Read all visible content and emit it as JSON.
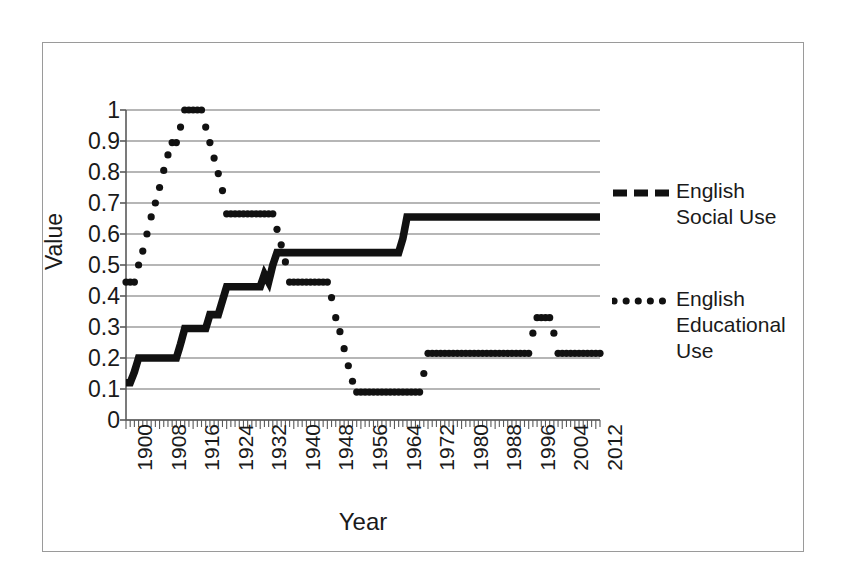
{
  "chart_data": {
    "type": "line",
    "title": "",
    "xlabel": "Year",
    "ylabel": "Value",
    "xlim": [
      1900,
      2013
    ],
    "ylim": [
      0,
      1
    ],
    "grid": true,
    "grid_axis": "y",
    "legend_position": "right",
    "y_ticks": [
      "0",
      "0.1",
      "0.2",
      "0.3",
      "0.4",
      "0.5",
      "0.6",
      "0.7",
      "0.8",
      "0.9",
      "1"
    ],
    "y_tick_values": [
      0,
      0.1,
      0.2,
      0.3,
      0.4,
      0.5,
      0.6,
      0.7,
      0.8,
      0.9,
      1
    ],
    "x_ticks": [
      "1900",
      "1908",
      "1916",
      "1924",
      "1932",
      "1940",
      "1948",
      "1956",
      "1964",
      "1972",
      "1980",
      "1988",
      "1996",
      "2004",
      "2012"
    ],
    "x_tick_values": [
      1900,
      1908,
      1916,
      1924,
      1932,
      1940,
      1948,
      1956,
      1964,
      1972,
      1980,
      1988,
      1996,
      2004,
      2012
    ],
    "x_minor_tick_step": 1,
    "series": [
      {
        "name": "English Social Use",
        "style": "dashed",
        "marker": "dash",
        "color": "#111111",
        "points": [
          [
            1900,
            0.12
          ],
          [
            1901,
            0.12
          ],
          [
            1902,
            0.155
          ],
          [
            1903,
            0.2
          ],
          [
            1904,
            0.2
          ],
          [
            1905,
            0.2
          ],
          [
            1906,
            0.2
          ],
          [
            1907,
            0.2
          ],
          [
            1908,
            0.2
          ],
          [
            1909,
            0.2
          ],
          [
            1910,
            0.2
          ],
          [
            1911,
            0.2
          ],
          [
            1912,
            0.2
          ],
          [
            1913,
            0.245
          ],
          [
            1914,
            0.295
          ],
          [
            1915,
            0.295
          ],
          [
            1916,
            0.295
          ],
          [
            1917,
            0.295
          ],
          [
            1918,
            0.295
          ],
          [
            1919,
            0.295
          ],
          [
            1920,
            0.34
          ],
          [
            1921,
            0.34
          ],
          [
            1922,
            0.34
          ],
          [
            1923,
            0.385
          ],
          [
            1924,
            0.43
          ],
          [
            1925,
            0.43
          ],
          [
            1926,
            0.43
          ],
          [
            1927,
            0.43
          ],
          [
            1928,
            0.43
          ],
          [
            1929,
            0.43
          ],
          [
            1930,
            0.43
          ],
          [
            1931,
            0.43
          ],
          [
            1932,
            0.43
          ],
          [
            1933,
            0.47
          ],
          [
            1934,
            0.445
          ],
          [
            1935,
            0.5
          ],
          [
            1936,
            0.54
          ],
          [
            1937,
            0.54
          ],
          [
            1938,
            0.54
          ],
          [
            1939,
            0.54
          ],
          [
            1940,
            0.54
          ],
          [
            1941,
            0.54
          ],
          [
            1942,
            0.54
          ],
          [
            1943,
            0.54
          ],
          [
            1944,
            0.54
          ],
          [
            1945,
            0.54
          ],
          [
            1946,
            0.54
          ],
          [
            1947,
            0.54
          ],
          [
            1948,
            0.54
          ],
          [
            1949,
            0.54
          ],
          [
            1950,
            0.54
          ],
          [
            1951,
            0.54
          ],
          [
            1952,
            0.54
          ],
          [
            1953,
            0.54
          ],
          [
            1954,
            0.54
          ],
          [
            1955,
            0.54
          ],
          [
            1956,
            0.54
          ],
          [
            1957,
            0.54
          ],
          [
            1958,
            0.54
          ],
          [
            1959,
            0.54
          ],
          [
            1960,
            0.54
          ],
          [
            1961,
            0.54
          ],
          [
            1962,
            0.54
          ],
          [
            1963,
            0.54
          ],
          [
            1964,
            0.54
          ],
          [
            1965,
            0.54
          ],
          [
            1966,
            0.585
          ],
          [
            1967,
            0.655
          ],
          [
            1968,
            0.655
          ],
          [
            1969,
            0.655
          ],
          [
            1970,
            0.655
          ],
          [
            1971,
            0.655
          ],
          [
            1972,
            0.655
          ],
          [
            1973,
            0.655
          ],
          [
            1974,
            0.655
          ],
          [
            1975,
            0.655
          ],
          [
            1976,
            0.655
          ],
          [
            1977,
            0.655
          ],
          [
            1978,
            0.655
          ],
          [
            1979,
            0.655
          ],
          [
            1980,
            0.655
          ],
          [
            1981,
            0.655
          ],
          [
            1982,
            0.655
          ],
          [
            1983,
            0.655
          ],
          [
            1984,
            0.655
          ],
          [
            1985,
            0.655
          ],
          [
            1986,
            0.655
          ],
          [
            1987,
            0.655
          ],
          [
            1988,
            0.655
          ],
          [
            1989,
            0.655
          ],
          [
            1990,
            0.655
          ],
          [
            1991,
            0.655
          ],
          [
            1992,
            0.655
          ],
          [
            1993,
            0.655
          ],
          [
            1994,
            0.655
          ],
          [
            1995,
            0.655
          ],
          [
            1996,
            0.655
          ],
          [
            1997,
            0.655
          ],
          [
            1998,
            0.655
          ],
          [
            1999,
            0.655
          ],
          [
            2000,
            0.655
          ],
          [
            2001,
            0.655
          ],
          [
            2002,
            0.655
          ],
          [
            2003,
            0.655
          ],
          [
            2004,
            0.655
          ],
          [
            2005,
            0.655
          ],
          [
            2006,
            0.655
          ],
          [
            2007,
            0.655
          ],
          [
            2008,
            0.655
          ],
          [
            2009,
            0.655
          ],
          [
            2010,
            0.655
          ],
          [
            2011,
            0.655
          ],
          [
            2012,
            0.655
          ],
          [
            2013,
            0.655
          ]
        ]
      },
      {
        "name": "English Educational Use",
        "style": "dotted",
        "marker": "dot",
        "color": "#111111",
        "points": [
          [
            1900,
            0.445
          ],
          [
            1901,
            0.445
          ],
          [
            1902,
            0.445
          ],
          [
            1903,
            0.5
          ],
          [
            1904,
            0.545
          ],
          [
            1905,
            0.6
          ],
          [
            1906,
            0.655
          ],
          [
            1907,
            0.7
          ],
          [
            1908,
            0.75
          ],
          [
            1909,
            0.805
          ],
          [
            1910,
            0.855
          ],
          [
            1911,
            0.895
          ],
          [
            1912,
            0.895
          ],
          [
            1913,
            0.945
          ],
          [
            1914,
            1.0
          ],
          [
            1915,
            1.0
          ],
          [
            1916,
            1.0
          ],
          [
            1917,
            1.0
          ],
          [
            1918,
            1.0
          ],
          [
            1919,
            0.945
          ],
          [
            1920,
            0.895
          ],
          [
            1921,
            0.845
          ],
          [
            1922,
            0.795
          ],
          [
            1923,
            0.74
          ],
          [
            1924,
            0.665
          ],
          [
            1925,
            0.665
          ],
          [
            1926,
            0.665
          ],
          [
            1927,
            0.665
          ],
          [
            1928,
            0.665
          ],
          [
            1929,
            0.665
          ],
          [
            1930,
            0.665
          ],
          [
            1931,
            0.665
          ],
          [
            1932,
            0.665
          ],
          [
            1933,
            0.665
          ],
          [
            1934,
            0.665
          ],
          [
            1935,
            0.665
          ],
          [
            1936,
            0.615
          ],
          [
            1937,
            0.565
          ],
          [
            1938,
            0.51
          ],
          [
            1939,
            0.445
          ],
          [
            1940,
            0.445
          ],
          [
            1941,
            0.445
          ],
          [
            1942,
            0.445
          ],
          [
            1943,
            0.445
          ],
          [
            1944,
            0.445
          ],
          [
            1945,
            0.445
          ],
          [
            1946,
            0.445
          ],
          [
            1947,
            0.445
          ],
          [
            1948,
            0.445
          ],
          [
            1949,
            0.395
          ],
          [
            1950,
            0.33
          ],
          [
            1951,
            0.285
          ],
          [
            1952,
            0.23
          ],
          [
            1953,
            0.175
          ],
          [
            1954,
            0.125
          ],
          [
            1955,
            0.09
          ],
          [
            1956,
            0.09
          ],
          [
            1957,
            0.09
          ],
          [
            1958,
            0.09
          ],
          [
            1959,
            0.09
          ],
          [
            1960,
            0.09
          ],
          [
            1961,
            0.09
          ],
          [
            1962,
            0.09
          ],
          [
            1963,
            0.09
          ],
          [
            1964,
            0.09
          ],
          [
            1965,
            0.09
          ],
          [
            1966,
            0.09
          ],
          [
            1967,
            0.09
          ],
          [
            1968,
            0.09
          ],
          [
            1969,
            0.09
          ],
          [
            1970,
            0.09
          ],
          [
            1971,
            0.15
          ],
          [
            1972,
            0.215
          ],
          [
            1973,
            0.215
          ],
          [
            1974,
            0.215
          ],
          [
            1975,
            0.215
          ],
          [
            1976,
            0.215
          ],
          [
            1977,
            0.215
          ],
          [
            1978,
            0.215
          ],
          [
            1979,
            0.215
          ],
          [
            1980,
            0.215
          ],
          [
            1981,
            0.215
          ],
          [
            1982,
            0.215
          ],
          [
            1983,
            0.215
          ],
          [
            1984,
            0.215
          ],
          [
            1985,
            0.215
          ],
          [
            1986,
            0.215
          ],
          [
            1987,
            0.215
          ],
          [
            1988,
            0.215
          ],
          [
            1989,
            0.215
          ],
          [
            1990,
            0.215
          ],
          [
            1991,
            0.215
          ],
          [
            1992,
            0.215
          ],
          [
            1993,
            0.215
          ],
          [
            1994,
            0.215
          ],
          [
            1995,
            0.215
          ],
          [
            1996,
            0.215
          ],
          [
            1997,
            0.28
          ],
          [
            1998,
            0.33
          ],
          [
            1999,
            0.33
          ],
          [
            2000,
            0.33
          ],
          [
            2001,
            0.33
          ],
          [
            2002,
            0.28
          ],
          [
            2003,
            0.215
          ],
          [
            2004,
            0.215
          ],
          [
            2005,
            0.215
          ],
          [
            2006,
            0.215
          ],
          [
            2007,
            0.215
          ],
          [
            2008,
            0.215
          ],
          [
            2009,
            0.215
          ],
          [
            2010,
            0.215
          ],
          [
            2011,
            0.215
          ],
          [
            2012,
            0.215
          ],
          [
            2013,
            0.215
          ]
        ]
      }
    ]
  },
  "legend": {
    "entries": [
      {
        "label": "English\nSocial Use",
        "style": "dashed"
      },
      {
        "label": "English\nEducational\nUse",
        "style": "dotted"
      }
    ]
  },
  "axes": {
    "y_title": "Value",
    "x_title": "Year"
  },
  "colors": {
    "series": "#111111",
    "gridline": "#6e6e6e",
    "axis": "#5a5a5a",
    "frame": "#9a9a9a",
    "background": "#ffffff"
  }
}
